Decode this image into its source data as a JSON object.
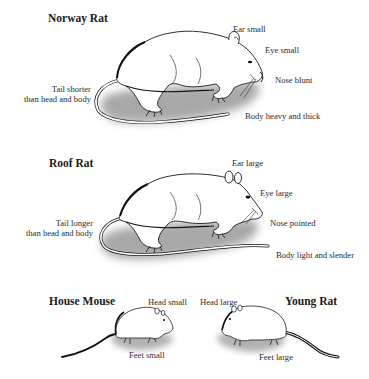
{
  "diagram": {
    "sections": [
      {
        "name": "Norway Rat",
        "labels": {
          "ear": "Ear small",
          "eye": "Eye small",
          "nose": "Nose blunt",
          "body": "Body heavy and thick",
          "tail_line1": "Tail shorter",
          "tail_line2": "than head and body"
        }
      },
      {
        "name": "Roof Rat",
        "labels": {
          "ear": "Ear large",
          "eye": "Eye large",
          "nose": "Nose pointed",
          "body": "Body light and slender",
          "tail_line1": "Tail longer",
          "tail_line2": "than head and body"
        }
      },
      {
        "name": "House Mouse",
        "labels": {
          "head": "Head small",
          "feet": "Feet small"
        }
      },
      {
        "name": "Young Rat",
        "labels": {
          "head": "Head large",
          "feet": "Feet large"
        }
      }
    ]
  }
}
